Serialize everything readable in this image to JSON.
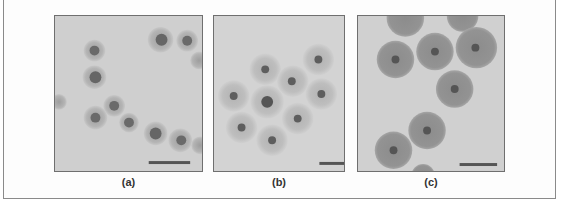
{
  "figure": {
    "panels": [
      {
        "id": "a",
        "label": "(a)",
        "description": "micrograph of small particles with dark cores and thin halos",
        "background": "#cfcfcf"
      },
      {
        "id": "b",
        "label": "(b)",
        "description": "micrograph of particles with dark cores and wide pale halos",
        "background": "#d3d3d3"
      },
      {
        "id": "c",
        "label": "(c)",
        "description": "micrograph of large dark-shelled particles with small cores",
        "background": "#d0d0d0"
      }
    ],
    "scale_bar_color": "#555555"
  }
}
